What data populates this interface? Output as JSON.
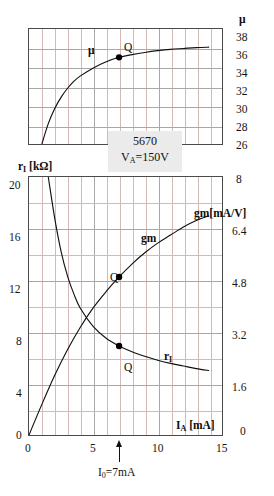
{
  "header_strip": {
    "text": "",
    "visible": true
  },
  "device": {
    "name": "5670",
    "condition": "V",
    "condition_sub": "A",
    "condition_value": "=150V"
  },
  "operating_point": {
    "marker_label": "Q",
    "caption_prefix": "I",
    "caption_sub": "0",
    "caption_value": "=7mA"
  },
  "axes": {
    "mu": {
      "name": "μ",
      "ticks": [
        "38",
        "36",
        "34",
        "32",
        "30",
        "28",
        "26"
      ]
    },
    "ri": {
      "name": "r",
      "name_sub": "I",
      "name_unit": " [kΩ]",
      "ticks": [
        "20",
        "16",
        "12",
        "8",
        "4",
        "0"
      ]
    },
    "gm": {
      "name": "gm[mA/V]",
      "ticks": [
        "8",
        "6.4",
        "4.8",
        "3.2",
        "1.6",
        "0"
      ]
    },
    "ia": {
      "name": "I",
      "name_sub": "A",
      "name_unit": " [mA]",
      "ticks": [
        "0",
        "5",
        "10",
        "15"
      ]
    }
  },
  "curve_labels": {
    "mu": "μ",
    "gm": "gm",
    "ri": "r",
    "ri_sub": "I"
  },
  "chart_data": {
    "type": "line",
    "subtitle": "VA=150V",
    "xlabel": "I_A [mA]",
    "xlim": [
      0,
      15
    ],
    "xticks": [
      0,
      5,
      10,
      15
    ],
    "grid": true,
    "legend": "inline-curve-labels",
    "panels": [
      {
        "panel": "upper",
        "ylabel": "μ",
        "ylim": [
          25,
          38
        ],
        "yticks": [
          26,
          28,
          30,
          32,
          34,
          36,
          38
        ],
        "series": [
          {
            "name": "μ",
            "x": [
              1.0,
              1.5,
              2.0,
              2.5,
              3.0,
              3.5,
              4.0,
              5.0,
              6.0,
              7.0,
              8.0,
              9.0,
              10.0,
              11.0,
              12.0,
              13.0,
              14.0
            ],
            "y": [
              25.0,
              27.3,
              29.0,
              30.3,
              31.3,
              32.1,
              32.7,
              33.6,
              34.3,
              34.8,
              35.1,
              35.35,
              35.55,
              35.7,
              35.8,
              35.9,
              35.95
            ]
          }
        ],
        "markers": [
          {
            "label": "Q",
            "x": 7.0,
            "y": 34.8
          }
        ]
      },
      {
        "panel": "lower",
        "ylabel_left": "r_I [kΩ]",
        "ylim_left": [
          0,
          20
        ],
        "yticks_left": [
          0,
          4,
          8,
          12,
          16,
          20
        ],
        "ylabel_right": "gm [mA/V]",
        "ylim_right": [
          0,
          8
        ],
        "yticks_right": [
          0,
          1.6,
          3.2,
          4.8,
          6.4,
          8
        ],
        "series": [
          {
            "name": "r_I",
            "axis": "left",
            "units": "kΩ",
            "x": [
              1.5,
              2.0,
              2.5,
              3.0,
              3.5,
              4.0,
              5.0,
              6.0,
              7.0,
              8.0,
              9.0,
              10.0,
              11.0,
              12.0,
              13.0,
              14.0
            ],
            "y": [
              20.0,
              16.8,
              14.2,
              12.3,
              10.9,
              9.8,
              8.4,
              7.5,
              6.9,
              6.45,
              6.1,
              5.8,
              5.55,
              5.35,
              5.15,
              5.0
            ]
          },
          {
            "name": "gm",
            "axis": "right",
            "units": "mA/V",
            "x": [
              0.0,
              1.0,
              2.0,
              3.0,
              4.0,
              5.0,
              6.0,
              7.0,
              8.0,
              9.0,
              10.0,
              11.0,
              12.0,
              13.0,
              14.0
            ],
            "y": [
              0.0,
              0.95,
              1.85,
              2.65,
              3.35,
              3.95,
              4.45,
              4.9,
              5.3,
              5.65,
              5.95,
              6.2,
              6.45,
              6.65,
              6.8
            ]
          }
        ],
        "markers": [
          {
            "label": "Q",
            "series": "gm",
            "x": 7.0,
            "y": 4.9
          },
          {
            "label": "Q",
            "series": "r_I",
            "x": 7.0,
            "y": 6.9
          }
        ]
      }
    ],
    "annotations": [
      {
        "text": "5670",
        "type": "device-name"
      },
      {
        "text": "VA=150V",
        "type": "condition"
      },
      {
        "text": "I0 =7mA",
        "type": "operating-point",
        "x": 7.0
      }
    ]
  }
}
